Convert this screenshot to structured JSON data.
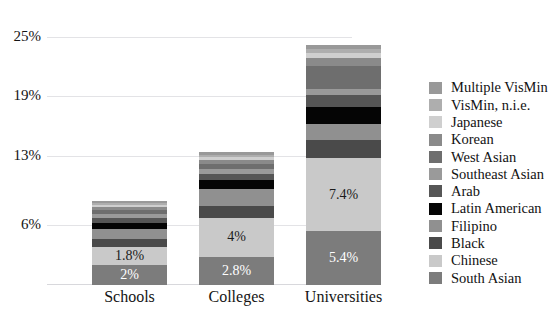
{
  "chart_data": {
    "type": "bar",
    "title": "",
    "xlabel": "",
    "ylabel": "",
    "categories": [
      "Schools",
      "Colleges",
      "Universities"
    ],
    "ylim": [
      0,
      26.5
    ],
    "yticks": [
      "6%",
      "13%",
      "19%",
      "25%"
    ],
    "ytick_values": [
      6,
      13,
      19,
      25
    ],
    "grid": true,
    "stacked": true,
    "legend_position": "right",
    "series": [
      {
        "name": "South Asian",
        "color": "#7c7c7c",
        "values": [
          2.0,
          2.8,
          5.4
        ],
        "labels": [
          "2%",
          "2.8%",
          "5.4%"
        ]
      },
      {
        "name": "Chinese",
        "color": "#c9c9c9",
        "values": [
          1.8,
          4.0,
          7.4
        ],
        "labels": [
          "1.8%",
          "4%",
          "7.4%"
        ]
      },
      {
        "name": "Black",
        "color": "#4a4a4a",
        "values": [
          0.8,
          1.2,
          1.8
        ],
        "labels": [
          "",
          "",
          ""
        ]
      },
      {
        "name": "Filipino",
        "color": "#909090",
        "values": [
          1.0,
          1.7,
          1.6
        ],
        "labels": [
          "",
          "",
          ""
        ]
      },
      {
        "name": "Latin American",
        "color": "#050505",
        "values": [
          0.7,
          0.9,
          1.7
        ],
        "labels": [
          "",
          "",
          ""
        ]
      },
      {
        "name": "Arab",
        "color": "#565656",
        "values": [
          0.5,
          0.6,
          1.2
        ],
        "labels": [
          "",
          "",
          ""
        ]
      },
      {
        "name": "Southeast Asian",
        "color": "#9a9a9a",
        "values": [
          0.4,
          0.5,
          0.7
        ],
        "labels": [
          "",
          "",
          ""
        ]
      },
      {
        "name": "West Asian",
        "color": "#6e6e6e",
        "values": [
          0.4,
          0.5,
          2.3
        ],
        "labels": [
          "",
          "",
          ""
        ]
      },
      {
        "name": "Korean",
        "color": "#8a8a8a",
        "values": [
          0.3,
          0.4,
          0.8
        ],
        "labels": [
          "",
          "",
          ""
        ]
      },
      {
        "name": "Japanese",
        "color": "#cfcfcf",
        "values": [
          0.2,
          0.3,
          0.5
        ],
        "labels": [
          "",
          "",
          ""
        ]
      },
      {
        "name": "VisMin, n.i.e.",
        "color": "#aeaeae",
        "values": [
          0.2,
          0.2,
          0.4
        ],
        "labels": [
          "",
          "",
          ""
        ]
      },
      {
        "name": "Multiple VisMin",
        "color": "#999999",
        "values": [
          0.2,
          0.3,
          0.4
        ],
        "labels": [
          "",
          "",
          ""
        ]
      }
    ],
    "legend_order": [
      "Multiple VisMin",
      "VisMin, n.i.e.",
      "Japanese",
      "Korean",
      "West Asian",
      "Southeast Asian",
      "Arab",
      "Latin American",
      "Filipino",
      "Black",
      "Chinese",
      "South Asian"
    ]
  },
  "legend": {
    "items": [
      {
        "label": "Multiple VisMin",
        "color": "#999999"
      },
      {
        "label": "VisMin, n.i.e.",
        "color": "#aeaeae"
      },
      {
        "label": "Japanese",
        "color": "#cfcfcf"
      },
      {
        "label": "Korean",
        "color": "#8a8a8a"
      },
      {
        "label": "West Asian",
        "color": "#6e6e6e"
      },
      {
        "label": "Southeast Asian",
        "color": "#9a9a9a"
      },
      {
        "label": "Arab",
        "color": "#565656"
      },
      {
        "label": "Latin American",
        "color": "#050505"
      },
      {
        "label": "Filipino",
        "color": "#909090"
      },
      {
        "label": "Black",
        "color": "#4a4a4a"
      },
      {
        "label": "Chinese",
        "color": "#c9c9c9"
      },
      {
        "label": "South Asian",
        "color": "#7c7c7c"
      }
    ]
  },
  "axis": {
    "y_ticks": [
      "25%",
      "19%",
      "13%",
      "6%"
    ],
    "x_labels": [
      "Schools",
      "Colleges",
      "Universities"
    ]
  },
  "colors": {
    "grid": "#e3e3e6",
    "axis_text": "#141414",
    "background": "#ffffff"
  }
}
